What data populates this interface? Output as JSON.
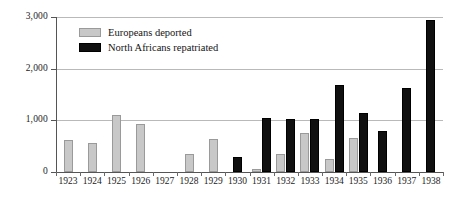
{
  "chart_data": {
    "type": "bar",
    "title": "",
    "subtitle": "",
    "xlabel": "",
    "ylabel": "",
    "ylim": [
      0,
      3000
    ],
    "yticks": [
      0,
      1000,
      2000,
      3000
    ],
    "ytick_labels": [
      "0",
      "1,000",
      "2,000",
      "3,000"
    ],
    "grid": true,
    "legend_position": "top-left",
    "categories": [
      "1923",
      "1924",
      "1925",
      "1926",
      "1927",
      "1928",
      "1929",
      "1930",
      "1931",
      "1932",
      "1933",
      "1934",
      "1935",
      "1936",
      "1937",
      "1938"
    ],
    "series": [
      {
        "name": "Europeans deported",
        "color": "#c8c8c8",
        "values": [
          610,
          570,
          1110,
          930,
          0,
          350,
          640,
          0,
          50,
          350,
          760,
          260,
          660,
          0,
          0,
          0
        ]
      },
      {
        "name": "North Africans repatriated",
        "color": "#101010",
        "values": [
          0,
          0,
          0,
          0,
          0,
          0,
          0,
          290,
          1050,
          1030,
          1030,
          1680,
          1140,
          800,
          1620,
          2950
        ]
      }
    ]
  },
  "legend": {
    "items": [
      {
        "label": "Europeans deported",
        "swatch": "grey"
      },
      {
        "label": "North Africans repatriated",
        "swatch": "black"
      }
    ]
  },
  "colors": {
    "europeans": "#c8c8c8",
    "north_africans": "#101010",
    "gridline": "#b9b9b9",
    "axis": "#555555",
    "background": "#ffffff"
  }
}
